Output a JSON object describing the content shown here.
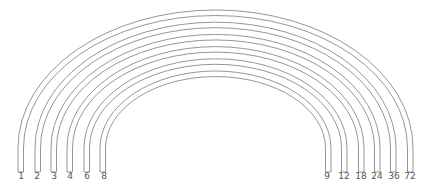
{
  "diagram": {
    "title": "",
    "stroke_color": "#8a8a8a",
    "label_color": "#555555",
    "left_labels": [
      "1",
      "2",
      "3",
      "4",
      "6",
      "8"
    ],
    "right_labels": [
      "9",
      "12",
      "18",
      "24",
      "36",
      "72"
    ],
    "pairs": [
      {
        "left": "1",
        "right": "72"
      },
      {
        "left": "2",
        "right": "36"
      },
      {
        "left": "3",
        "right": "24"
      },
      {
        "left": "4",
        "right": "18"
      },
      {
        "left": "6",
        "right": "12"
      },
      {
        "left": "8",
        "right": "9"
      }
    ]
  }
}
